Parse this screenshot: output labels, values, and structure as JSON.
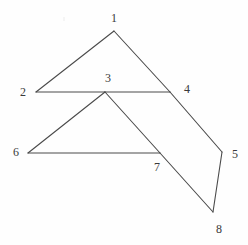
{
  "figure": {
    "background_color": "#fefefe",
    "stroke_color": "#4a4a4a",
    "label_color": "#3a3a3a",
    "stroke_width": 1.1,
    "canvas": {
      "width": 248,
      "height": 245
    },
    "vertices": [
      {
        "id": "1",
        "label": "1",
        "x": 114,
        "y": 31,
        "label_x": 114,
        "label_y": 18
      },
      {
        "id": "2",
        "label": "2",
        "x": 36,
        "y": 92,
        "label_x": 23,
        "label_y": 92
      },
      {
        "id": "3",
        "label": "3",
        "x": 105,
        "y": 92,
        "label_x": 108,
        "label_y": 78
      },
      {
        "id": "4",
        "label": "4",
        "x": 170,
        "y": 92,
        "label_x": 187,
        "label_y": 89
      },
      {
        "id": "5",
        "label": "5",
        "x": 222,
        "y": 152,
        "label_x": 235,
        "label_y": 154
      },
      {
        "id": "6",
        "label": "6",
        "x": 28,
        "y": 153,
        "label_x": 16,
        "label_y": 152
      },
      {
        "id": "7",
        "label": "7",
        "x": 160,
        "y": 153,
        "label_x": 157,
        "label_y": 167
      },
      {
        "id": "8",
        "label": "8",
        "x": 213,
        "y": 212,
        "label_x": 219,
        "label_y": 229
      }
    ],
    "edges": [
      {
        "name": "edge-1-2",
        "from": "1",
        "to": "2"
      },
      {
        "name": "edge-1-4",
        "from": "1",
        "to": "4"
      },
      {
        "name": "edge-2-3",
        "from": "2",
        "to": "3"
      },
      {
        "name": "edge-3-4",
        "from": "3",
        "to": "4"
      },
      {
        "name": "edge-4-5",
        "from": "4",
        "to": "5"
      },
      {
        "name": "edge-3-6",
        "from": "3",
        "to": "6"
      },
      {
        "name": "edge-3-7",
        "from": "3",
        "to": "7"
      },
      {
        "name": "edge-6-7",
        "from": "6",
        "to": "7"
      },
      {
        "name": "edge-7-8",
        "from": "7",
        "to": "8"
      },
      {
        "name": "edge-5-8",
        "from": "5",
        "to": "8"
      }
    ],
    "specks": [
      {
        "x": 63,
        "y": 17
      }
    ]
  }
}
